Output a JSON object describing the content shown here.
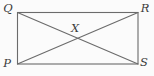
{
  "diagram": {
    "shape": "rectangle",
    "vertices": {
      "top_left": {
        "label": "Q"
      },
      "top_right": {
        "label": "R"
      },
      "bottom_left": {
        "label": "P"
      },
      "bottom_right": {
        "label": "S"
      }
    },
    "diagonals": [
      {
        "from": "Q",
        "to": "S"
      },
      {
        "from": "P",
        "to": "R"
      }
    ],
    "intersection": {
      "label": "X"
    },
    "colors": {
      "line": "#6b6b6b",
      "label": "#3c3c3c",
      "background": "#fbfbfb"
    }
  }
}
